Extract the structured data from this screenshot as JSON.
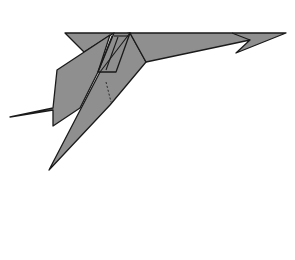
{
  "diagram": {
    "type": "origami-fold-illustration",
    "colors": {
      "paper_fill": "#8f8f8f",
      "outline": "#1a1a1a",
      "background": "#ffffff"
    },
    "elements": [
      {
        "name": "top-flap",
        "description": "long horizontal top edge ending in hooked point at right"
      },
      {
        "name": "right-hook",
        "description": "arrow-like notch near right tip"
      },
      {
        "name": "left-arm",
        "description": "bent flap extending down-left with pointed tip"
      },
      {
        "name": "long-spike",
        "description": "long narrow point extending down-left"
      },
      {
        "name": "dashed-fold-line",
        "description": "short dashed hidden-fold line in the center"
      }
    ],
    "caption": ""
  }
}
